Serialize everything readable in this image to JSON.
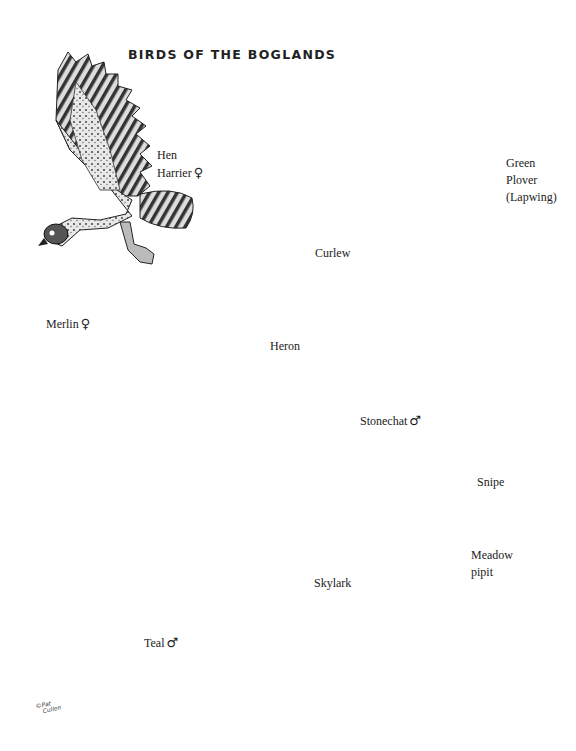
{
  "title": "BIRDS OF THE BOGLANDS",
  "symbols": {
    "female": "♀",
    "male": "♂"
  },
  "birds": [
    {
      "id": "hen-harrier",
      "line1": "Hen",
      "line2": "Harrier",
      "sex": "♀"
    },
    {
      "id": "merlin",
      "line1": "Merlin",
      "sex": "♀"
    },
    {
      "id": "heron",
      "line1": "Heron"
    },
    {
      "id": "green-plover",
      "line1": "Green",
      "line2": "Plover",
      "line3": "(Lapwing)"
    },
    {
      "id": "curlew",
      "line1": "Curlew"
    },
    {
      "id": "stonechat",
      "line1": "Stonechat",
      "sex": "♂"
    },
    {
      "id": "snipe",
      "line1": "Snipe"
    },
    {
      "id": "meadow-pipit",
      "line1": "Meadow",
      "line2": "pipit"
    },
    {
      "id": "skylark",
      "line1": "Skylark"
    },
    {
      "id": "teal",
      "line1": "Teal",
      "sex": "♂"
    }
  ],
  "signature": {
    "line1": "©Pat",
    "line2": "Cullen"
  },
  "colors": {
    "ink": "#1a1a1a",
    "wash": "#9a9a9a",
    "paper": "#ffffff"
  }
}
